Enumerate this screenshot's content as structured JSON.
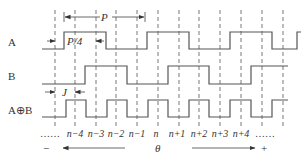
{
  "diagram": {
    "type": "timing-diagram",
    "signals": [
      {
        "name": "A",
        "label": "A",
        "low_y": 49,
        "high_y": 32,
        "edges": [
          64,
          106,
          147,
          189,
          230,
          272,
          297
        ],
        "start_level": "low",
        "x_start": 42,
        "x_end": 301
      },
      {
        "name": "B",
        "label": "B",
        "low_y": 84,
        "high_y": 66,
        "edges": [
          85,
          127,
          168,
          209,
          251
        ],
        "start_level": "low",
        "x_start": 42,
        "x_end": 288
      },
      {
        "name": "AxorB",
        "label": "A⊕B",
        "low_y": 117,
        "high_y": 100,
        "edges": [
          66,
          86,
          107,
          127,
          148,
          168,
          189,
          209,
          230,
          251,
          272
        ],
        "start_level": "low",
        "x_start": 42,
        "x_end": 288
      }
    ],
    "dashed_lines_x": [
      55,
      75,
      96,
      116,
      137,
      158,
      179,
      199,
      220,
      241,
      262,
      283
    ],
    "dimensions": {
      "period": {
        "label": "P",
        "x1": 64,
        "x2": 145,
        "y": 17
      },
      "quarter_period": {
        "label": "P/4",
        "x1": 55,
        "x2": 96,
        "y": 41
      },
      "offset": {
        "label": "J",
        "x1": 55,
        "x2": 75,
        "y": 92
      }
    },
    "axis": {
      "ticks": [
        "……",
        "n−4",
        "n−3",
        "n−2",
        "n−1",
        "n",
        "n+1",
        "n+2",
        "n+3",
        "n+4",
        "……"
      ],
      "tick_x": [
        50,
        75,
        96,
        116,
        137,
        156,
        177,
        199,
        220,
        241,
        265
      ],
      "variable": "θ",
      "minus_label": "−",
      "plus_label": "+",
      "left_arrow": {
        "x1": 125,
        "x2": 63,
        "y": 148
      },
      "right_arrow": {
        "x1": 192,
        "x2": 255,
        "y": 148
      }
    },
    "colors": {
      "stroke": "#555555",
      "text": "#333333",
      "background": "#ffffff"
    }
  }
}
